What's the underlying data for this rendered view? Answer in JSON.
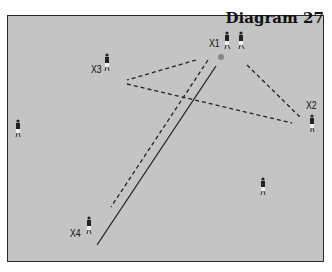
{
  "diagram": {
    "title": "Diagram 27",
    "players": [
      {
        "label": "X1",
        "x": 227,
        "y": 40
      },
      {
        "label": "",
        "x": 241,
        "y": 40
      },
      {
        "label": "X2",
        "x": 312,
        "y": 123
      },
      {
        "label": "X3",
        "x": 107,
        "y": 62
      },
      {
        "label": "",
        "x": 18,
        "y": 128
      },
      {
        "label": "X4",
        "x": 89,
        "y": 225
      },
      {
        "label": "",
        "x": 263,
        "y": 186
      }
    ],
    "ball": {
      "x": 221,
      "y": 57
    },
    "colors": {
      "field": "#c4c4c4",
      "border": "#2a2a2a",
      "lines": "#222222"
    }
  }
}
